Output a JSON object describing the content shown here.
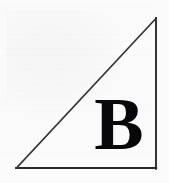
{
  "figure": {
    "kind": "geometry-diagram",
    "label": "B",
    "label_style": "bold-serif",
    "background_color": "#fbfbfb",
    "stroke_color": "#2b2b2b",
    "label_color": "#08080a",
    "canvas": {
      "width": 169,
      "height": 183
    },
    "triangle": {
      "vertices": [
        {
          "name": "lower-left",
          "x": 16,
          "y": 168
        },
        {
          "name": "lower-right",
          "x": 156,
          "y": 168
        },
        {
          "name": "upper-right",
          "x": 156,
          "y": 18
        }
      ],
      "edges": [
        {
          "name": "hypotenuse",
          "from": "lower-left",
          "to": "upper-right"
        },
        {
          "name": "base",
          "from": "lower-left",
          "to": "lower-right"
        },
        {
          "name": "vertical-leg",
          "from": "lower-right",
          "to": "upper-right"
        }
      ],
      "stroke_width": 1.8
    },
    "label_position": {
      "x": 92,
      "y": 100,
      "width": 55,
      "height": 53
    }
  }
}
